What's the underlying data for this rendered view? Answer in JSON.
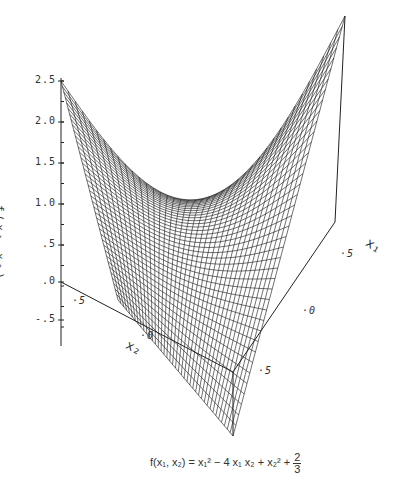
{
  "chart_data": {
    "type": "surface3d",
    "title": "",
    "caption": "f(x1, x2) = x1^2 - 4 x1 x2 + x2^2 + 2/3",
    "function": "x1^2 - 4*x1*x2 + x2^2 + 2/3",
    "zlabel": "f(x1,x2)",
    "xlabel": "x1",
    "ylabel": "x2",
    "z_ticks": [
      "2.5",
      "2.0",
      "1.5",
      "1.0",
      ".5",
      ".0",
      "-.5"
    ],
    "x1_ticks": [
      ".5",
      ".0",
      ".5"
    ],
    "x2_ticks": [
      ".5",
      ".0"
    ],
    "zlim": [
      -0.8,
      2.5
    ],
    "grid_lines": 40,
    "render": "wireframe mesh, black lines on white"
  },
  "labels": {
    "z_axis": "f(x₁,x₂)",
    "x1_axis": "x₁",
    "x2_axis": "x₂",
    "caption_prefix": "f(x₁, x₂) = x₁² − 4 x₁ x₂ + x₂² + ",
    "caption_frac_num": "2",
    "caption_frac_den": "3"
  },
  "ticks": {
    "z": [
      {
        "label": "2.5",
        "y": 81
      },
      {
        "label": "2.0",
        "y": 122
      },
      {
        "label": "1.5",
        "y": 163
      },
      {
        "label": "1.0",
        "y": 204
      },
      {
        "label": ".5",
        "y": 245
      },
      {
        "label": ".0",
        "y": 282
      },
      {
        "label": "-.5",
        "y": 320
      }
    ],
    "x2": [
      {
        "label": ".5",
        "x": 72,
        "y": 295
      },
      {
        "label": ".0",
        "x": 140,
        "y": 330
      }
    ],
    "x1": [
      {
        "label": ".5",
        "x": 258,
        "y": 365
      },
      {
        "label": ".0",
        "x": 302,
        "y": 305
      },
      {
        "label": ".5",
        "x": 340,
        "y": 248
      }
    ]
  }
}
